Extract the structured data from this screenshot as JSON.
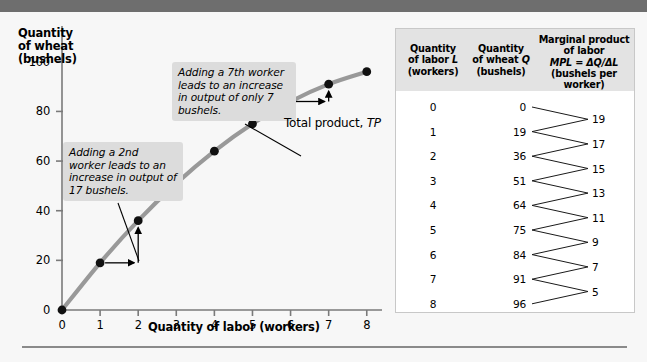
{
  "figure": {
    "background_color": "#f7f7f7",
    "banner_color": "#6e6e6e",
    "curve_color": "#999999",
    "marker_color": "#111111",
    "callout_bg": "#dcdcdc",
    "table_header_bg": "#e3e3e3"
  },
  "chart_data": {
    "type": "line",
    "title": "",
    "xlabel": "Quantity of labor (workers)",
    "ylabel": "Quantity of wheat (bushels)",
    "ylabel_lines": [
      "Quantity",
      "of wheat",
      "(bushels)"
    ],
    "x": [
      0,
      1,
      2,
      3,
      4,
      5,
      6,
      7,
      8
    ],
    "values": [
      0,
      19,
      36,
      51,
      64,
      75,
      84,
      91,
      96
    ],
    "series": [
      {
        "name": "Total product, TP",
        "values": [
          0,
          19,
          36,
          51,
          64,
          75,
          84,
          91,
          96
        ]
      }
    ],
    "xlim": [
      0,
      8.4
    ],
    "ylim": [
      0,
      112
    ],
    "xticks": [
      "0",
      "1",
      "2",
      "3",
      "4",
      "5",
      "6",
      "7",
      "8"
    ],
    "yticks": [
      "0",
      "20",
      "40",
      "60",
      "80",
      "100"
    ],
    "ytick_values": [
      0,
      20,
      40,
      60,
      80,
      100
    ],
    "grid": false,
    "legend": "none",
    "markers": "filled-circle",
    "annotations": [
      {
        "name": "callout-2nd-worker",
        "text": "Adding a 2nd worker leads to an increase in output of 17 bushels.",
        "points_to": {
          "x": 1.45,
          "y": 27.5
        }
      },
      {
        "name": "callout-7th-worker",
        "text": "Adding a 7th worker leads to an increase in output of only 7 bushels.",
        "points_to": {
          "x": 6.5,
          "y": 87.5
        }
      },
      {
        "name": "curve-label",
        "text_prefix": "Total product, ",
        "text_italic": "TP"
      }
    ],
    "step_arrows": [
      {
        "name": "step-arrow-2nd",
        "from": {
          "x": 1,
          "y": 19
        },
        "to": {
          "x": 2,
          "y": 36
        }
      },
      {
        "name": "step-arrow-7th",
        "from": {
          "x": 6,
          "y": 84
        },
        "to": {
          "x": 7,
          "y": 91
        }
      }
    ]
  },
  "table": {
    "headers": {
      "labor": {
        "line1": "Quantity",
        "line2_prefix": "of labor ",
        "line2_italic": "L",
        "line3": "(workers)"
      },
      "wheat": {
        "line1": "Quantity",
        "line2_prefix": "of wheat ",
        "line2_italic": "Q",
        "line3": "(bushels)"
      },
      "mpl": {
        "line1": "Marginal product",
        "line2": "of labor",
        "line3_italic": "MPL",
        "line3_rest": " = ΔQ/ΔL",
        "line4": "(bushels per worker)"
      }
    },
    "rows": [
      {
        "labor": "0",
        "wheat": "0"
      },
      {
        "labor": "1",
        "wheat": "19"
      },
      {
        "labor": "2",
        "wheat": "36"
      },
      {
        "labor": "3",
        "wheat": "51"
      },
      {
        "labor": "4",
        "wheat": "64"
      },
      {
        "labor": "5",
        "wheat": "75"
      },
      {
        "labor": "6",
        "wheat": "84"
      },
      {
        "labor": "7",
        "wheat": "91"
      },
      {
        "labor": "8",
        "wheat": "96"
      }
    ],
    "mpl_values": [
      "19",
      "17",
      "15",
      "13",
      "11",
      "9",
      "7",
      "5"
    ]
  }
}
